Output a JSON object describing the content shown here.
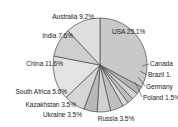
{
  "chart_data": {
    "type": "pie",
    "title": "",
    "subtitle": "",
    "xlabel": "",
    "ylabel": "",
    "legend_position": "none",
    "grid": false,
    "label_format": "{name} {value}%",
    "start_angle_deg": 0,
    "direction": "clockwise",
    "categories": [
      "USA",
      "Canada",
      "Brazil",
      "Germany",
      "Poland",
      "Russia",
      "Ukraine",
      "Kazakhstan",
      "South Africa",
      "China",
      "India",
      "Australia"
    ],
    "values": [
      25.1,
      2.0,
      1.8,
      1.6,
      1.5,
      3.5,
      3.5,
      3.5,
      5.6,
      11.6,
      7.6,
      9.2
    ],
    "slices": [
      {
        "name": "USA",
        "value": 25.1,
        "label": "USA 25.1%",
        "label_text_clipped": false,
        "color": "#c9c9c9"
      },
      {
        "name": "Canada",
        "value": 2.0,
        "label": "Canada",
        "label_text_clipped": true,
        "color": "#b4b4b4"
      },
      {
        "name": "Brazil",
        "value": 1.8,
        "label": "Brazil 1.",
        "label_text_clipped": true,
        "color": "#d4d4d4"
      },
      {
        "name": "Germany",
        "value": 1.6,
        "label": "Germany",
        "label_text_clipped": true,
        "color": "#bdbdbd"
      },
      {
        "name": "Poland",
        "value": 1.5,
        "label": "Poland 1.5%",
        "label_text_clipped": true,
        "color": "#d9d9d9"
      },
      {
        "name": "Russia",
        "value": 3.5,
        "label": "Russia 3.5%",
        "label_text_clipped": false,
        "color": "#bfbfbf"
      },
      {
        "name": "Ukraine",
        "value": 3.5,
        "label": "Ukraine 3.5%",
        "label_text_clipped": false,
        "color": "#d2d2d2"
      },
      {
        "name": "Kazakhstan",
        "value": 3.5,
        "label": "Kazakhstan 3.5%",
        "label_text_clipped": false,
        "color": "#b9b9b9"
      },
      {
        "name": "South Africa",
        "value": 5.6,
        "label": "South Africa 5.6%",
        "label_text_clipped": false,
        "color": "#d6d6d6"
      },
      {
        "name": "China",
        "value": 11.6,
        "label": "China 11.6%",
        "label_text_clipped": false,
        "color": "#e3e3e3"
      },
      {
        "name": "India",
        "value": 7.6,
        "label": "India 7.6%",
        "label_text_clipped": false,
        "color": "#cfcfcf"
      },
      {
        "name": "Australia",
        "value": 9.2,
        "label": "Australia 9.2%",
        "label_text_clipped": false,
        "color": "#dedede"
      }
    ],
    "colors": {
      "background": "#ffffff",
      "slice_outline": "#4a4a4a",
      "leader_line": "#555555",
      "label_text": "#1d1d1d"
    },
    "geometry": {
      "center_x": 100,
      "center_y": 65,
      "radius": 47
    }
  }
}
